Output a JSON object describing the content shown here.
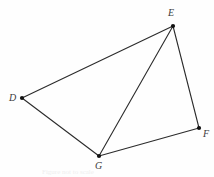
{
  "figure": {
    "background_color": "#fefefe",
    "stroke_color": "#2b2b2b",
    "vertex_dot_color": "#111111",
    "label_color": "#3a3a3a",
    "stroke_width": 1.1,
    "caption_text": "Figure not to scale",
    "vertices": [
      {
        "name": "D",
        "label": "D",
        "x": 22,
        "y": 98,
        "label_x": 9,
        "label_y": 93
      },
      {
        "name": "E",
        "label": "E",
        "x": 173,
        "y": 26,
        "label_x": 168,
        "label_y": 8
      },
      {
        "name": "F",
        "label": "F",
        "x": 199,
        "y": 128,
        "label_x": 203,
        "label_y": 129
      },
      {
        "name": "G",
        "label": "G",
        "x": 99,
        "y": 156,
        "label_x": 95,
        "label_y": 161
      }
    ],
    "edges": [
      {
        "name": "edge-DE",
        "from": "D",
        "to": "E",
        "x1": 22,
        "y1": 98,
        "x2": 173,
        "y2": 26
      },
      {
        "name": "edge-EF",
        "from": "E",
        "to": "F",
        "x1": 173,
        "y1": 26,
        "x2": 199,
        "y2": 128
      },
      {
        "name": "edge-FG",
        "from": "F",
        "to": "G",
        "x1": 199,
        "y1": 128,
        "x2": 99,
        "y2": 156
      },
      {
        "name": "edge-GD",
        "from": "G",
        "to": "D",
        "x1": 99,
        "y1": 156,
        "x2": 22,
        "y2": 98
      },
      {
        "name": "diagonal-EG",
        "from": "E",
        "to": "G",
        "x1": 173,
        "y1": 26,
        "x2": 99,
        "y2": 156
      }
    ]
  }
}
